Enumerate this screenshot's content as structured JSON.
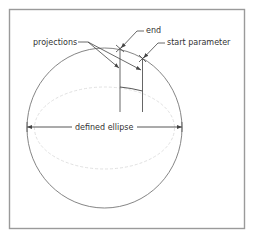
{
  "diagram": {
    "type": "technical-drawing",
    "labels": {
      "projections": "projections",
      "end": "end",
      "start_parameter": "start parameter",
      "defined_ellipse": "defined ellipse"
    },
    "colors": {
      "frame": "#9a9a9a",
      "line": "#555555",
      "dashed": "#dddddd",
      "text": "#333333"
    }
  }
}
